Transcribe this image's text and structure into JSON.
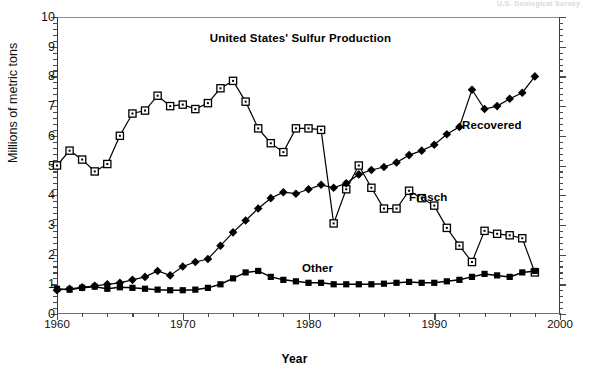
{
  "figure": {
    "top_fragment": "U.S. Geological Survey",
    "x_axis_title": "Year",
    "y_axis_title": "Millions of metric tons"
  },
  "chart_data": {
    "type": "line",
    "title": "United States' Sulfur Production",
    "xlabel": "Year",
    "ylabel": "Millions of metric tons",
    "xlim": [
      1960,
      2000
    ],
    "ylim": [
      0,
      10
    ],
    "xticks": [
      1960,
      1970,
      1980,
      1990,
      2000
    ],
    "yticks": [
      0,
      1,
      2,
      3,
      4,
      5,
      6,
      7,
      8,
      9,
      10
    ],
    "x_minor_step": 2,
    "y_minor_step": 0.2,
    "grid": false,
    "legend_position": "inline-annotations",
    "x": [
      1960,
      1961,
      1962,
      1963,
      1964,
      1965,
      1966,
      1967,
      1968,
      1969,
      1970,
      1971,
      1972,
      1973,
      1974,
      1975,
      1976,
      1977,
      1978,
      1979,
      1980,
      1981,
      1982,
      1983,
      1984,
      1985,
      1986,
      1987,
      1988,
      1989,
      1990,
      1991,
      1992,
      1993,
      1994,
      1995,
      1996,
      1997,
      1998
    ],
    "series": [
      {
        "name": "Frasch",
        "marker": "open-square",
        "color": "#000000",
        "values": [
          5.0,
          5.5,
          5.2,
          4.8,
          5.05,
          6.0,
          6.75,
          6.85,
          7.35,
          7.0,
          7.05,
          6.9,
          7.1,
          7.6,
          7.85,
          7.15,
          6.25,
          5.75,
          5.45,
          6.25,
          6.25,
          6.2,
          3.05,
          4.2,
          5.0,
          4.25,
          3.55,
          3.55,
          4.15,
          3.9,
          3.65,
          2.9,
          2.3,
          1.75,
          2.8,
          2.7,
          2.65,
          2.55,
          1.4
        ]
      },
      {
        "name": "Recovered",
        "marker": "filled-diamond",
        "color": "#000000",
        "values": [
          0.8,
          0.85,
          0.9,
          0.95,
          1.0,
          1.05,
          1.15,
          1.25,
          1.45,
          1.3,
          1.6,
          1.75,
          1.85,
          2.3,
          2.75,
          3.15,
          3.55,
          3.9,
          4.1,
          4.05,
          4.2,
          4.35,
          4.25,
          4.4,
          4.7,
          4.85,
          4.95,
          5.1,
          5.35,
          5.5,
          5.7,
          6.05,
          6.3,
          7.55,
          6.9,
          7.0,
          7.25,
          7.45,
          8.0
        ]
      },
      {
        "name": "Other",
        "marker": "filled-square",
        "color": "#000000",
        "values": [
          0.85,
          0.82,
          0.88,
          0.92,
          0.85,
          0.9,
          0.88,
          0.85,
          0.82,
          0.8,
          0.8,
          0.82,
          0.88,
          1.0,
          1.2,
          1.4,
          1.45,
          1.25,
          1.15,
          1.1,
          1.05,
          1.05,
          1.0,
          1.0,
          1.0,
          1.0,
          1.02,
          1.05,
          1.08,
          1.05,
          1.05,
          1.1,
          1.15,
          1.25,
          1.35,
          1.3,
          1.25,
          1.4,
          1.45
        ]
      }
    ],
    "annotations": [
      {
        "text": "Recovered",
        "series": "Recovered"
      },
      {
        "text": "Frasch",
        "series": "Frasch"
      },
      {
        "text": "Other",
        "series": "Other"
      }
    ]
  }
}
